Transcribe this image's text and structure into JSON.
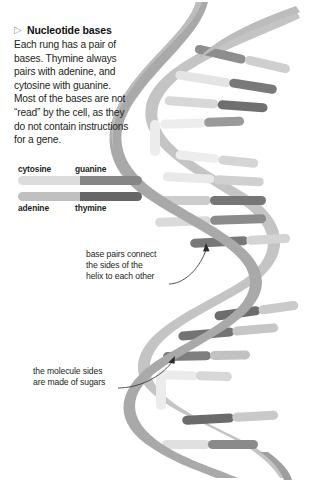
{
  "figure": {
    "background_color": "#ffffff"
  },
  "callout": {
    "bullet_icon": "triangle-right-icon",
    "bullet_glyph": "▷",
    "heading": "Nucleotide bases",
    "body_lines": [
      "Each rung has a pair of",
      "bases. Thymine always",
      "pairs with adenine, and",
      "cytosine with guanine.",
      "Most of the bases are not",
      "“read” by the cell, as they",
      "do not contain instructions",
      "for a gene."
    ]
  },
  "legend": {
    "rows": [
      {
        "labels_position": "above",
        "left_label": "cytosine",
        "right_label": "guanine",
        "left_color": "#dcdcdc",
        "right_color": "#868686"
      },
      {
        "labels_position": "below",
        "left_label": "adenine",
        "right_label": "thymine",
        "left_color": "#c0c0c0",
        "right_color": "#666666"
      }
    ]
  },
  "annotations": [
    {
      "id": "base-pairs",
      "lines": [
        "base pairs connect",
        "the sides of the",
        "helix to each other"
      ],
      "points_to": "base pair rung junction"
    },
    {
      "id": "molecule-sides",
      "lines": [
        "the molecule sides",
        "are made of sugars"
      ],
      "points_to": "helix sugar-phosphate backbone"
    }
  ],
  "colors": {
    "backbone_light": "#b7b7b7",
    "backbone_mid": "#a3a3a3",
    "backbone_dark": "#949494",
    "base_lightest": "#e8e8e8",
    "base_light": "#d2d2d2",
    "base_mid": "#a8a8a8",
    "base_dark": "#7d7d7d",
    "base_darkest": "#616161",
    "text": "#231f20",
    "arrow": "#2b2b2b"
  }
}
